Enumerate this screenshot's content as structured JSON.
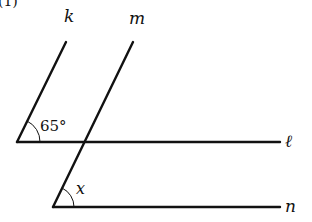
{
  "problem_label": "(1)",
  "lines": {
    "k": {
      "label": "k",
      "x1": 17,
      "y1": 142,
      "x2": 66,
      "y2": 42
    },
    "m": {
      "label": "m",
      "x1": 53,
      "y1": 207,
      "x2": 133,
      "y2": 42
    },
    "l": {
      "label": "ℓ",
      "x1": 17,
      "y1": 142,
      "x2": 280,
      "y2": 142
    },
    "n": {
      "label": "n",
      "x1": 53,
      "y1": 207,
      "x2": 280,
      "y2": 207
    }
  },
  "angles": {
    "given": {
      "label": "65°",
      "vertex": "k∩ℓ"
    },
    "unknown": {
      "label": "x",
      "vertex": "m∩n"
    }
  },
  "colors": {
    "stroke": "#111111",
    "background": "#ffffff"
  }
}
